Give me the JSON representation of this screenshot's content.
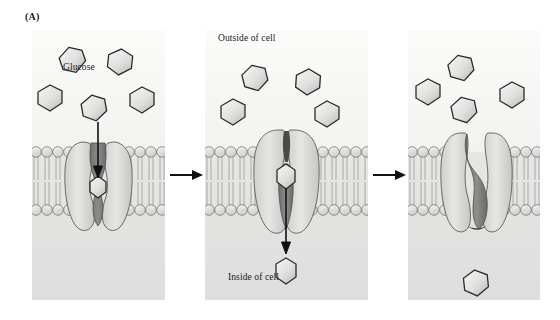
{
  "figure": {
    "panel_label": "(A)",
    "caption_glucose": "Glucose",
    "caption_outside": "Outside of cell",
    "caption_inside": "Inside of cell",
    "icons": {
      "arrow_between_panels_1": "right-arrow-icon",
      "arrow_between_panels_2": "right-arrow-icon",
      "glucose_entry_arrow": "down-arrow-icon",
      "glucose_exit_arrow": "down-arrow-icon"
    }
  },
  "colors": {
    "background": "#ffffff",
    "panel_extracellular": "#f7f7f5",
    "panel_cytosol": "#e3e3e1",
    "membrane_head": "#e8e8e6",
    "membrane_head_stroke": "#6b6b6b",
    "membrane_tail": "#9a9a9a",
    "transporter_light": "#dcdcda",
    "transporter_mid": "#bdbdbb",
    "transporter_channel_dark": "#7d7d7b",
    "glucose_fill_light": "#efefed",
    "glucose_fill_mid": "#c9c9c7",
    "glucose_stroke": "#2b2b2b",
    "arrow": "#111111",
    "text": "#1b1b1b"
  },
  "panels": [
    {
      "id": "panel-1",
      "name": "glucose-binding-outward-open",
      "state_label": "Glucose binds to outward-open transporter",
      "glucose_outside_count": 5,
      "glucose_in_channel": 1,
      "glucose_inside_count": 0,
      "transporter_conformation": "outward-open",
      "arrow_direction": "down",
      "glucose_outside": [
        {
          "cx": 40,
          "cy": 30,
          "r": 13,
          "rot": -18
        },
        {
          "cx": 88,
          "cy": 32,
          "r": 13,
          "rot": 6
        },
        {
          "cx": 18,
          "cy": 68,
          "r": 13,
          "rot": 0
        },
        {
          "cx": 110,
          "cy": 70,
          "r": 13,
          "rot": 0
        },
        {
          "cx": 62,
          "cy": 78,
          "r": 13,
          "rot": -12
        }
      ]
    },
    {
      "id": "panel-2",
      "name": "occluded-release-inward",
      "state_label": "Glucose occluded then released to cytosol",
      "glucose_outside_count": 4,
      "glucose_in_channel": 1,
      "glucose_inside_count": 1,
      "transporter_conformation": "occluded",
      "arrow_direction": "down",
      "glucose_outside": [
        {
          "cx": 50,
          "cy": 48,
          "r": 13,
          "rot": -18
        },
        {
          "cx": 103,
          "cy": 52,
          "r": 13,
          "rot": 4
        },
        {
          "cx": 28,
          "cy": 82,
          "r": 13,
          "rot": 0
        },
        {
          "cx": 122,
          "cy": 84,
          "r": 13,
          "rot": 0
        }
      ]
    },
    {
      "id": "panel-3",
      "name": "inward-open-reset",
      "state_label": "Transporter resets; glucose free inside cell",
      "glucose_outside_count": 4,
      "glucose_in_channel": 0,
      "glucose_inside_count": 1,
      "transporter_conformation": "inward-open-closed",
      "arrow_direction": "none",
      "glucose_outside": [
        {
          "cx": 53,
          "cy": 38,
          "r": 13,
          "rot": -16
        },
        {
          "cx": 20,
          "cy": 62,
          "r": 13,
          "rot": 0
        },
        {
          "cx": 104,
          "cy": 65,
          "r": 13,
          "rot": 0
        },
        {
          "cx": 56,
          "cy": 80,
          "r": 13,
          "rot": -14
        }
      ]
    }
  ],
  "membrane": {
    "label": "phospholipid-bilayer",
    "top_y": 120,
    "bottom_y": 182,
    "leaflet_count": 2,
    "head_radius": 5.5
  }
}
